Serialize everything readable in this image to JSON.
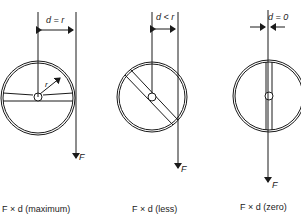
{
  "diagrams": [
    {
      "dim_label": "d = r",
      "force_label": "F",
      "radius_label": "r",
      "caption": "F × d (maximum)"
    },
    {
      "dim_label": "d < r",
      "force_label": "F",
      "caption": "F × d (less)"
    },
    {
      "dim_label": "d = 0",
      "force_label": "F",
      "caption": "F × d (zero)"
    }
  ],
  "colors": {
    "stroke": "#1a1a1a",
    "background": "#ffffff"
  }
}
